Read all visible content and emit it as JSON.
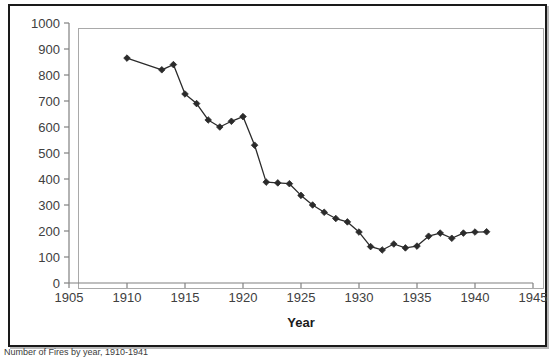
{
  "figure": {
    "caption": "Number of Fires by year, 1910-1941",
    "frame_color": "#1a1a1a",
    "plot_border_color": "#a9a9a9",
    "series_color": "#2b2b2b"
  },
  "chart_data": {
    "type": "line",
    "title": "",
    "subtitle": "",
    "xlabel": "Year",
    "ylabel": "",
    "grid": false,
    "legend": null,
    "marker": "diamond",
    "xlim": [
      1905,
      1945
    ],
    "ylim": [
      0,
      1000
    ],
    "xticks": [
      1905,
      1910,
      1915,
      1920,
      1925,
      1930,
      1935,
      1940,
      1945
    ],
    "yticks": [
      0,
      100,
      200,
      300,
      400,
      500,
      600,
      700,
      800,
      900,
      1000
    ],
    "xtick_labels": [
      "1905",
      "1910",
      "1915",
      "1920",
      "1925",
      "1930",
      "1935",
      "1940",
      "1945"
    ],
    "ytick_labels": [
      "0",
      "100",
      "200",
      "300",
      "400",
      "500",
      "600",
      "700",
      "800",
      "900",
      "1000"
    ],
    "x": [
      1910,
      1913,
      1914,
      1915,
      1916,
      1917,
      1918,
      1919,
      1920,
      1921,
      1922,
      1923,
      1924,
      1925,
      1926,
      1927,
      1928,
      1929,
      1930,
      1931,
      1932,
      1933,
      1934,
      1935,
      1936,
      1937,
      1938,
      1939,
      1940,
      1941
    ],
    "values": [
      865,
      820,
      840,
      727,
      690,
      627,
      600,
      622,
      640,
      530,
      388,
      385,
      382,
      337,
      300,
      272,
      248,
      235,
      196,
      140,
      127,
      150,
      135,
      142,
      180,
      192,
      172,
      192,
      196,
      197
    ],
    "series": [
      {
        "name": "Fires",
        "values": [
          865,
          820,
          840,
          727,
          690,
          627,
          600,
          622,
          640,
          530,
          388,
          385,
          382,
          337,
          300,
          272,
          248,
          235,
          196,
          140,
          127,
          150,
          135,
          142,
          180,
          192,
          172,
          192,
          196,
          197
        ]
      }
    ]
  }
}
